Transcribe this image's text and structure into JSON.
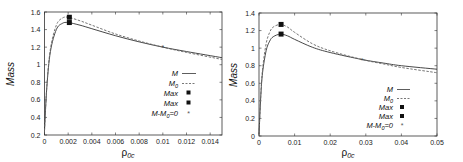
{
  "chart_data": [
    {
      "type": "line",
      "title": "",
      "xlabel": "ρ0c",
      "ylabel": "Mass",
      "xlim": [
        0,
        0.015
      ],
      "ylim": [
        0.2,
        1.6
      ],
      "x_ticks": [
        "0",
        "0.002",
        "0.004",
        "0.006",
        "0.008",
        "0.01",
        "0.012",
        "0.014"
      ],
      "y_ticks": [
        "0.2",
        "0.4",
        "0.6",
        "0.8",
        "1",
        "1.2",
        "1.4",
        "1.6"
      ],
      "grid": false,
      "legend_position": "center-right",
      "legend": [
        "M",
        "M0",
        "Max",
        "Max",
        "M-M0=0"
      ],
      "series": [
        {
          "name": "M",
          "style": "solid",
          "x": [
            0,
            0.0002,
            0.0005,
            0.001,
            0.0015,
            0.002,
            0.003,
            0.004,
            0.006,
            0.008,
            0.01,
            0.012,
            0.015
          ],
          "y": [
            0.25,
            0.75,
            1.15,
            1.4,
            1.47,
            1.48,
            1.45,
            1.41,
            1.33,
            1.26,
            1.2,
            1.15,
            1.08
          ]
        },
        {
          "name": "M0",
          "style": "dashed",
          "x": [
            0,
            0.0002,
            0.0005,
            0.001,
            0.0015,
            0.002,
            0.003,
            0.004,
            0.006,
            0.008,
            0.01,
            0.012,
            0.015
          ],
          "y": [
            0.25,
            0.76,
            1.18,
            1.45,
            1.53,
            1.54,
            1.5,
            1.45,
            1.35,
            1.27,
            1.2,
            1.14,
            1.06
          ]
        },
        {
          "name": "Max (M)",
          "style": "square",
          "x": [
            0.0021
          ],
          "y": [
            1.48
          ]
        },
        {
          "name": "Max (M0)",
          "style": "square",
          "x": [
            0.0021
          ],
          "y": [
            1.54
          ]
        },
        {
          "name": "M-M0=0",
          "style": "star",
          "x": [
            0.01
          ],
          "y": [
            1.2
          ]
        }
      ]
    },
    {
      "type": "line",
      "title": "",
      "xlabel": "ρ0c",
      "ylabel": "Mass",
      "xlim": [
        0,
        0.05
      ],
      "ylim": [
        0,
        1.4
      ],
      "x_ticks": [
        "0",
        "0.01",
        "0.02",
        "0.03",
        "0.04",
        "0.05"
      ],
      "y_ticks": [
        "0",
        "0.2",
        "0.4",
        "0.6",
        "0.8",
        "1",
        "1.2",
        "1.4"
      ],
      "grid": false,
      "legend_position": "bottom-right",
      "legend": [
        "M",
        "M0",
        "Max",
        "Max",
        "M-M0=0"
      ],
      "series": [
        {
          "name": "M",
          "style": "solid",
          "x": [
            0,
            0.0005,
            0.001,
            0.002,
            0.003,
            0.004,
            0.006,
            0.008,
            0.01,
            0.015,
            0.02,
            0.029,
            0.035,
            0.04,
            0.05
          ],
          "y": [
            0.02,
            0.45,
            0.72,
            0.97,
            1.08,
            1.13,
            1.16,
            1.14,
            1.1,
            1.01,
            0.95,
            0.87,
            0.83,
            0.8,
            0.76
          ]
        },
        {
          "name": "M0",
          "style": "dashed",
          "x": [
            0,
            0.0005,
            0.001,
            0.002,
            0.003,
            0.004,
            0.006,
            0.008,
            0.01,
            0.015,
            0.02,
            0.029,
            0.035,
            0.04,
            0.05
          ],
          "y": [
            0.02,
            0.46,
            0.76,
            1.05,
            1.18,
            1.24,
            1.27,
            1.24,
            1.18,
            1.05,
            0.97,
            0.87,
            0.82,
            0.78,
            0.72
          ]
        },
        {
          "name": "Max (M)",
          "style": "square",
          "x": [
            0.0062
          ],
          "y": [
            1.16
          ]
        },
        {
          "name": "Max (M0)",
          "style": "square",
          "x": [
            0.0062
          ],
          "y": [
            1.27
          ]
        },
        {
          "name": "M-M0=0",
          "style": "star",
          "x": [
            0.029
          ],
          "y": [
            0.87
          ]
        }
      ]
    }
  ],
  "panels": [
    {
      "legend_labels": {
        "m": "M",
        "m0_base": "M",
        "m0_sub": "0",
        "max1": "Max",
        "max2": "Max",
        "diff_a": "M-M",
        "diff_sub": "0",
        "diff_b": "=0"
      },
      "ylabel": "Mass",
      "xlabel_base": "ρ",
      "xlabel_sub": "0c"
    },
    {
      "legend_labels": {
        "m": "M",
        "m0_base": "M",
        "m0_sub": "0",
        "max1": "Max",
        "max2": "Max",
        "diff_a": "M-M",
        "diff_sub": "0",
        "diff_b": "=0"
      },
      "ylabel": "Mass",
      "xlabel_base": "ρ",
      "xlabel_sub": "0c"
    }
  ]
}
